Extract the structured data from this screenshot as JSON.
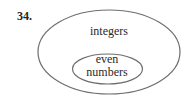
{
  "problem_number": "34.",
  "diagram": {
    "type": "venn-nested",
    "outer_set": {
      "label": "integers"
    },
    "inner_set": {
      "label_line1": "even",
      "label_line2": "numbers"
    },
    "stroke_color": "#6e6e6e"
  }
}
